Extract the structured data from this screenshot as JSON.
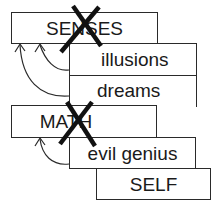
{
  "diagram": {
    "boxes": [
      {
        "id": "senses",
        "label": "SENSES",
        "crossed_out": true
      },
      {
        "id": "illusions",
        "label": "illusions",
        "crossed_out": false
      },
      {
        "id": "dreams",
        "label": "dreams",
        "crossed_out": false
      },
      {
        "id": "math",
        "label": "MATH",
        "crossed_out": true
      },
      {
        "id": "evil_genius",
        "label": "evil genius",
        "crossed_out": false
      },
      {
        "id": "self",
        "label": "SELF",
        "crossed_out": false
      }
    ],
    "arrows": [
      {
        "from": "illusions",
        "to": "senses"
      },
      {
        "from": "dreams",
        "to": "senses"
      },
      {
        "from": "evil_genius",
        "to": "math"
      }
    ],
    "colors": {
      "stroke": "#1a1a1a",
      "background": "#ffffff"
    }
  }
}
